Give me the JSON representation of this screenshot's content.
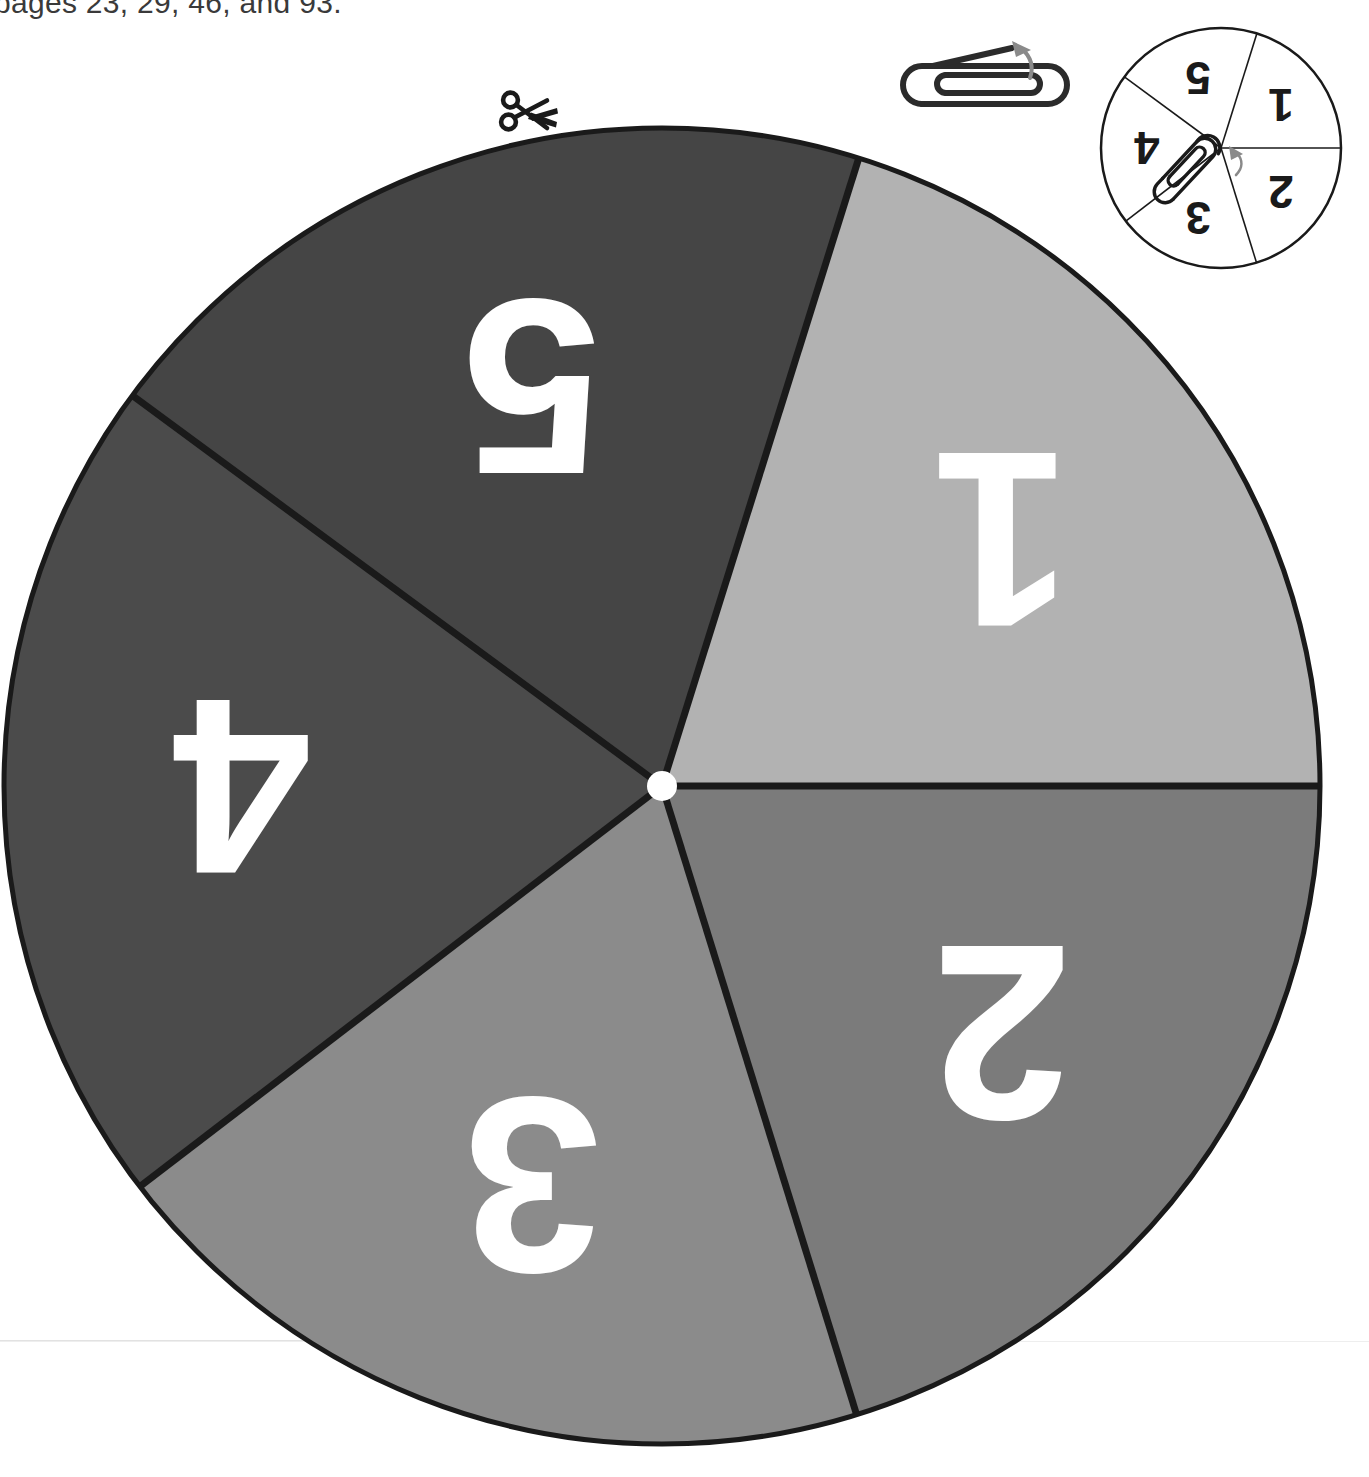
{
  "header": {
    "text": "pages 23, 29, 46, and 93."
  },
  "icons": {
    "scissors": "scissors-icon",
    "paperclip": "paperclip-icon",
    "arrow": "curved-arrow-icon",
    "spinner_hub": "hub-dot-icon"
  },
  "spinner": {
    "name": "number-spinner",
    "center": {
      "x": 662,
      "y": 786
    },
    "radius": 658,
    "hub_radius": 15,
    "hub_color": "#ffffff",
    "outline_color": "#1a1a1a",
    "outline_width": 5,
    "divider_width": 7,
    "label_rotation_deg": 180,
    "sectors": [
      {
        "label": "1",
        "color": "#b2b2b2",
        "start_deg": 0,
        "end_deg": 72.6,
        "label_angle_deg": 36,
        "label_radius": 420,
        "font_size": 250
      },
      {
        "label": "2",
        "color": "#7b7b7b",
        "start_deg": -72.8,
        "end_deg": 0,
        "label_angle_deg": -36,
        "label_radius": 420,
        "font_size": 250
      },
      {
        "label": "3",
        "color": "#8b8b8b",
        "start_deg": -142.5,
        "end_deg": -72.8,
        "label_angle_deg": -108,
        "label_radius": 420,
        "font_size": 250
      },
      {
        "label": "4",
        "color": "#4b4b4b",
        "start_deg": 143.6,
        "end_deg": 217.5,
        "label_angle_deg": 180,
        "label_radius": 420,
        "font_size": 250
      },
      {
        "label": "5",
        "color": "#454545",
        "start_deg": 72.6,
        "end_deg": 143.6,
        "label_angle_deg": 108,
        "label_radius": 420,
        "font_size": 250
      }
    ]
  },
  "mini_spinner": {
    "name": "reference-spinner",
    "center": {
      "x": 128,
      "y": 128
    },
    "radius": 120,
    "outline_color": "#1a1a1a",
    "outline_width": 2.5,
    "divider_width": 1.6,
    "face_color": "#ffffff",
    "label_rotation_deg": 180,
    "sectors": [
      {
        "label": "1",
        "start_deg": 0,
        "end_deg": 72.6,
        "label_angle_deg": 36,
        "label_radius": 74,
        "font_size": 46
      },
      {
        "label": "2",
        "start_deg": -72.8,
        "end_deg": 0,
        "label_angle_deg": -36,
        "label_radius": 74,
        "font_size": 46
      },
      {
        "label": "3",
        "start_deg": -142.5,
        "end_deg": -72.8,
        "label_angle_deg": -108,
        "label_radius": 74,
        "font_size": 46
      },
      {
        "label": "4",
        "start_deg": 143.6,
        "end_deg": 217.5,
        "label_angle_deg": 180,
        "label_radius": 74,
        "font_size": 46
      },
      {
        "label": "5",
        "start_deg": 72.6,
        "end_deg": 143.6,
        "label_angle_deg": 108,
        "label_radius": 74,
        "font_size": 46
      }
    ]
  },
  "colors": {
    "paper": "#ffffff",
    "ink": "#1a1a1a",
    "header_ink": "#3a3a3a",
    "rule": "#e2e2e2",
    "arrow_gray": "#8a8a8a"
  }
}
